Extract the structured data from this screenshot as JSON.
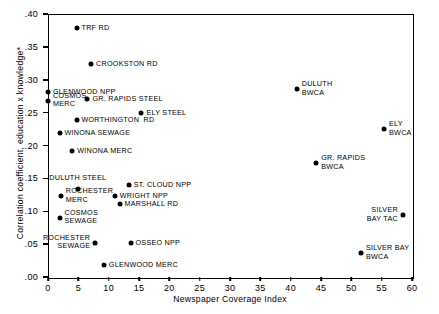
{
  "chart_data": {
    "type": "scatter",
    "title": "",
    "xlabel": "Newspaper Coverage Index",
    "ylabel": "Correlation coefficient, education x knowledge*",
    "xlim": [
      0,
      60
    ],
    "ylim": [
      0.0,
      0.4
    ],
    "xticks": [
      0,
      5,
      10,
      15,
      20,
      25,
      30,
      35,
      40,
      45,
      50,
      55,
      60
    ],
    "xtick_labels": [
      "0",
      "5",
      "10",
      "15",
      "20",
      "25",
      "30",
      "35",
      "40",
      "45",
      "50",
      "55",
      "60"
    ],
    "yticks": [
      0.0,
      0.05,
      0.1,
      0.15,
      0.2,
      0.25,
      0.3,
      0.35,
      0.4
    ],
    "ytick_labels": [
      ".00",
      ".05",
      ".10",
      ".15",
      ".20",
      ".25",
      ".30",
      ".35",
      ".40"
    ],
    "grid": false,
    "legend": "none",
    "marker_color": "#000000",
    "frame_color": "#000000",
    "background_color": "#ffffff",
    "points": [
      {
        "label": "TRF RD",
        "x": 4.7,
        "y": 0.378,
        "label_pos": "right"
      },
      {
        "label": "CROOKSTON RD",
        "x": 7.1,
        "y": 0.324,
        "label_pos": "right"
      },
      {
        "label": "GLENWOOD NPP",
        "x": 0.0,
        "y": 0.281,
        "label_pos": "right"
      },
      {
        "label": "DULUTH\nBWCA",
        "x": 41.0,
        "y": 0.286,
        "label_pos": "right"
      },
      {
        "label": "COSMOS\nMERC",
        "x": 0.0,
        "y": 0.268,
        "label_pos": "right"
      },
      {
        "label": "GR. RAPIDS STEEL",
        "x": 6.5,
        "y": 0.271,
        "label_pos": "right"
      },
      {
        "label": "ELY STEEL",
        "x": 15.4,
        "y": 0.25,
        "label_pos": "right"
      },
      {
        "label": "WORTHINGTON  RD",
        "x": 4.7,
        "y": 0.239,
        "label_pos": "right"
      },
      {
        "label": "ELY\nBWCA",
        "x": 55.4,
        "y": 0.225,
        "label_pos": "right"
      },
      {
        "label": "WINONA SEWAGE",
        "x": 1.9,
        "y": 0.219,
        "label_pos": "right"
      },
      {
        "label": "WINONA MERC",
        "x": 4.0,
        "y": 0.192,
        "label_pos": "right"
      },
      {
        "label": "GR. RAPIDS\nBWCA",
        "x": 44.2,
        "y": 0.173,
        "label_pos": "right"
      },
      {
        "label": "ST. CLOUD NPP",
        "x": 13.3,
        "y": 0.14,
        "label_pos": "right"
      },
      {
        "label": "DULUTH STEEL",
        "x": 4.9,
        "y": 0.134,
        "label_pos": "above"
      },
      {
        "label": "ROCHESTER\nMERC",
        "x": 2.1,
        "y": 0.123,
        "label_pos": "right"
      },
      {
        "label": "WRIGHT NPP",
        "x": 11.0,
        "y": 0.123,
        "label_pos": "right"
      },
      {
        "label": "MARSHALL RD",
        "x": 11.8,
        "y": 0.111,
        "label_pos": "right"
      },
      {
        "label": "COSMOS\nSEWAGE",
        "x": 1.9,
        "y": 0.09,
        "label_pos": "right"
      },
      {
        "label": "SILVER\nBAY TAC",
        "x": 58.5,
        "y": 0.094,
        "label_pos": "left"
      },
      {
        "label": "ROCHESTER\nSEWAGE",
        "x": 7.8,
        "y": 0.052,
        "label_pos": "left"
      },
      {
        "label": "OSSEO NPP",
        "x": 13.6,
        "y": 0.052,
        "label_pos": "right"
      },
      {
        "label": "SILVER BAY\nBWCA",
        "x": 51.6,
        "y": 0.036,
        "label_pos": "right"
      },
      {
        "label": "GLENWOOD MERC",
        "x": 9.2,
        "y": 0.018,
        "label_pos": "right"
      }
    ]
  }
}
